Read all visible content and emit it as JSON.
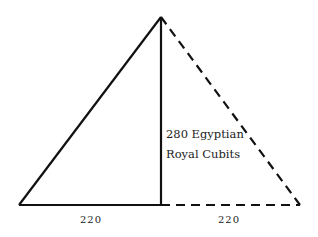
{
  "diagram": {
    "height_label_line1": "280 Egyptian",
    "height_label_line2": "Royal Cubits",
    "base_left_label": "220",
    "base_right_label": "220",
    "colors": {
      "stroke": "#111111",
      "text": "#222222",
      "background": "#ffffff"
    }
  }
}
